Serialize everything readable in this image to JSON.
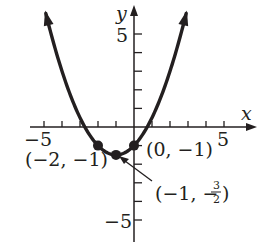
{
  "chart_data": {
    "type": "line",
    "title": "",
    "xlabel": "x",
    "ylabel": "y",
    "xlim": [
      -5.5,
      6.8
    ],
    "ylim": [
      -6.2,
      7
    ],
    "grid": false,
    "x_tick_labels": [
      "-5",
      "5"
    ],
    "y_tick_labels": [
      "5",
      "-5"
    ],
    "x_ticks": [
      -5,
      -4,
      -3,
      -2,
      -1,
      1,
      2,
      3,
      4,
      5
    ],
    "y_ticks": [
      -5,
      -4,
      -3,
      -2,
      -1,
      1,
      2,
      3,
      4,
      5
    ],
    "function": "y = (1/2)x^2 + x - 1",
    "curve_x_range": [
      -4.9,
      2.9
    ],
    "series": [
      {
        "name": "parabola",
        "x": [
          -4.9,
          -4,
          -3,
          -2,
          -1,
          0,
          1,
          2,
          2.9
        ],
        "y": [
          5.1,
          3,
          0.5,
          -1,
          -1.5,
          -1,
          0.5,
          3,
          5.1
        ]
      }
    ],
    "points": [
      {
        "x": -2,
        "y": -1,
        "label": "(−2, −1)"
      },
      {
        "x": -1,
        "y": -1.5,
        "label": "(−1, − 3/2)"
      },
      {
        "x": 0,
        "y": -1,
        "label": "(0, −1)"
      }
    ],
    "annotations": [
      {
        "text": "(−1, − 3/2)",
        "points_to": [
          -1,
          -1.5
        ],
        "arrow": true
      }
    ]
  },
  "labels": {
    "x_axis": "x",
    "y_axis": "y",
    "x_neg5": "−5",
    "x_pos5": "5",
    "y_pos5": "5",
    "y_neg5": "−5",
    "pt_a": "(−2, −1)",
    "pt_c": "(0, −1)",
    "pt_b_open": "(−1, −",
    "pt_b_num": "3",
    "pt_b_den": "2",
    "pt_b_close": ")"
  },
  "colors": {
    "ink": "#231f20",
    "background": "#ffffff"
  }
}
